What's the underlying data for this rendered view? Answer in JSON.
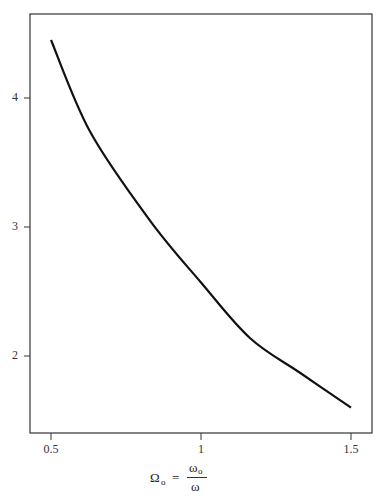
{
  "chart_data": {
    "type": "line",
    "title": "",
    "xlabel": "Ω₀ = ω₀ / ω",
    "ylabel": "",
    "xlim": [
      0.43,
      1.56
    ],
    "ylim": [
      1.4,
      4.7
    ],
    "grid": false,
    "legend": null,
    "x_ticks": [
      "0.5",
      "1",
      "1.5"
    ],
    "y_ticks": [
      "2",
      "3",
      "4"
    ],
    "series": [
      {
        "name": "curve",
        "x": [
          0.5,
          0.63,
          0.83,
          1.0,
          1.163,
          1.33,
          1.5
        ],
        "y": [
          4.45,
          3.74,
          3.05,
          2.57,
          2.14,
          1.87,
          1.6
        ]
      }
    ]
  },
  "axis": {
    "x_label_lhs": "Ω",
    "x_label_lhs_sub": "o",
    "x_label_eq": "=",
    "x_label_num": "ω",
    "x_label_num_sub": "o",
    "x_label_den": "ω"
  }
}
